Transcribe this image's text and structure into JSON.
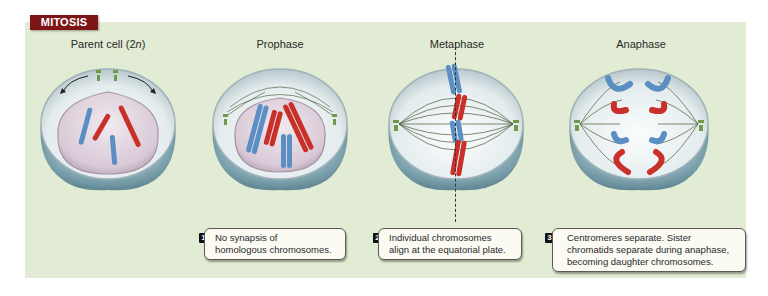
{
  "header": {
    "tab_label": "MITOSIS"
  },
  "stages": [
    {
      "title": "Parent cell (2",
      "title_italic": "n",
      "title_end": ")",
      "name": "parent-cell"
    },
    {
      "title": "Prophase",
      "name": "prophase"
    },
    {
      "title": "Metaphase",
      "name": "metaphase"
    },
    {
      "title": "Anaphase",
      "name": "anaphase"
    }
  ],
  "callouts": [
    {
      "number": "1",
      "lines": [
        "No synapsis of",
        "homologous chromosomes."
      ]
    },
    {
      "number": "2",
      "lines": [
        "Individual chromosomes",
        "align at the equatorial plate."
      ]
    },
    {
      "number": "3",
      "lines": [
        "Centromeres separate. Sister",
        "chromatids separate during anaphase,",
        "becoming daughter chromosomes."
      ]
    }
  ],
  "colors": {
    "panel_bg": "#e2ebd3",
    "tab_bg": "#7d1416",
    "chromosome_blue": "#5b8fc4",
    "chromosome_red": "#c9302a",
    "centriole_green": "#6e9a4a",
    "cell_base": "#8fb3bd",
    "nucleus": "#dcd0dc"
  }
}
